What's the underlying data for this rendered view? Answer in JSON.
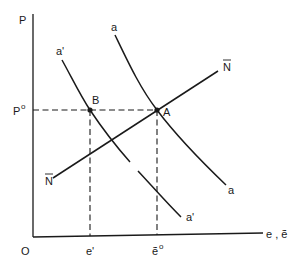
{
  "diagram": {
    "colors": {
      "ink": "#1a1a1a",
      "background": "#ffffff"
    },
    "axes": {
      "y_label": "P",
      "x_label": "e , ẽ",
      "origin_label": "O"
    },
    "ticks": {
      "y": [
        {
          "label": "P",
          "sup": "o",
          "at": "P0"
        }
      ],
      "x": [
        {
          "label": "e'",
          "at": "B"
        },
        {
          "label": "ẽ",
          "sup": "o",
          "at": "A"
        }
      ]
    },
    "curves": [
      {
        "id": "a",
        "label_top": "a",
        "label_bottom": "a",
        "shape": "downward-sloping convex"
      },
      {
        "id": "a_prime",
        "label_top": "a'",
        "label_bottom": "a'",
        "shape": "downward-sloping convex, shifted left of a"
      },
      {
        "id": "N_bar",
        "label_top": "N",
        "label_bottom": "N",
        "overbar": true,
        "shape": "upward-sloping line"
      }
    ],
    "points": [
      {
        "id": "A",
        "label": "A",
        "on": [
          "a",
          "N_bar"
        ],
        "price": "P0",
        "x_value": "ẽ0"
      },
      {
        "id": "B",
        "label": "B",
        "on": [
          "a_prime"
        ],
        "price": "P0",
        "x_value": "e'"
      }
    ],
    "guides": [
      {
        "type": "horizontal-dashed",
        "at": "P0",
        "from": "axis",
        "to": "A"
      },
      {
        "type": "vertical-dashed",
        "at": "e'",
        "from": "B",
        "to": "axis"
      },
      {
        "type": "vertical-dashed",
        "at": "ẽ0",
        "from": "A",
        "to": "axis"
      }
    ]
  }
}
